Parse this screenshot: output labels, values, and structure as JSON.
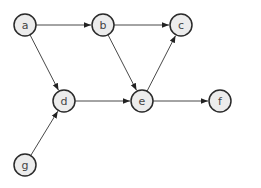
{
  "diagram": {
    "type": "directed-graph",
    "node_radius": 11,
    "colors": {
      "node_fill": "#ececec",
      "node_stroke": "#2a2a2a",
      "edge": "#333333",
      "label": "#444444"
    },
    "nodes": [
      {
        "id": "a",
        "label": "a",
        "x": 25,
        "y": 25
      },
      {
        "id": "b",
        "label": "b",
        "x": 103,
        "y": 25
      },
      {
        "id": "c",
        "label": "c",
        "x": 181,
        "y": 25
      },
      {
        "id": "d",
        "label": "d",
        "x": 64,
        "y": 101
      },
      {
        "id": "e",
        "label": "e",
        "x": 142,
        "y": 101
      },
      {
        "id": "f",
        "label": "f",
        "x": 220,
        "y": 101
      },
      {
        "id": "g",
        "label": "g",
        "x": 25,
        "y": 165
      }
    ],
    "edges": [
      {
        "from": "a",
        "to": "b"
      },
      {
        "from": "a",
        "to": "d"
      },
      {
        "from": "b",
        "to": "c"
      },
      {
        "from": "b",
        "to": "e"
      },
      {
        "from": "d",
        "to": "e"
      },
      {
        "from": "e",
        "to": "c"
      },
      {
        "from": "e",
        "to": "f"
      },
      {
        "from": "g",
        "to": "d"
      }
    ]
  }
}
